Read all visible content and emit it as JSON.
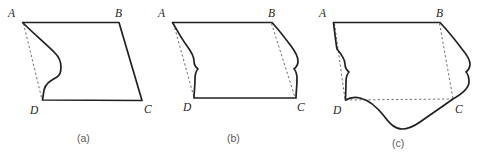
{
  "figure_set": {
    "background_color": "#ffffff",
    "stroke_color": "#231f20",
    "dashed_color": "#6d6a6b",
    "caption_color": "#58595b",
    "description": "Three quadrilateral diagrams ABCD with progressively more deformed (wavy) edges",
    "figures": [
      {
        "caption": "(a)",
        "vertices": {
          "A": {
            "label": "A",
            "x": 22,
            "y": 22
          },
          "B": {
            "label": "B",
            "x": 119,
            "y": 22
          },
          "C": {
            "label": "C",
            "x": 142,
            "y": 101
          },
          "D": {
            "label": "D",
            "x": 42,
            "y": 100
          }
        },
        "edges": {
          "AB": "straight",
          "BC": "straight",
          "CD": "straight",
          "DA": "wavy"
        },
        "dashed_diagonals": [
          "AD"
        ]
      },
      {
        "caption": "(b)",
        "vertices": {
          "A": {
            "label": "A",
            "x": 17,
            "y": 22
          },
          "B": {
            "label": "B",
            "x": 117,
            "y": 22
          },
          "C": {
            "label": "C",
            "x": 141,
            "y": 98
          },
          "D": {
            "label": "D",
            "x": 39,
            "y": 98
          }
        },
        "edges": {
          "AB": "straight",
          "BC": "wavy",
          "CD": "straight",
          "DA": "wavy"
        },
        "dashed_diagonals": [
          "AD",
          "BC"
        ]
      },
      {
        "caption": "(c)",
        "vertices": {
          "A": {
            "label": "A",
            "x": 23,
            "y": 22
          },
          "B": {
            "label": "B",
            "x": 130,
            "y": 22
          },
          "C": {
            "label": "C",
            "x": 143,
            "y": 99
          },
          "D": {
            "label": "D",
            "x": 35,
            "y": 100
          },
          "Dp": {
            "label": "D",
            "x": 35,
            "y": 100
          }
        },
        "edges": {
          "AB": "straight",
          "BC": "wavy",
          "CD": "wavy",
          "DA": "wavy"
        },
        "dashed_diagonals": [
          "AD",
          "BC",
          "DC"
        ]
      }
    ],
    "captions": {
      "a": "(a)",
      "b": "(b)",
      "c": "(c)"
    },
    "vertex_names": {
      "a": "A",
      "b": "B",
      "c": "C",
      "d": "D"
    }
  }
}
